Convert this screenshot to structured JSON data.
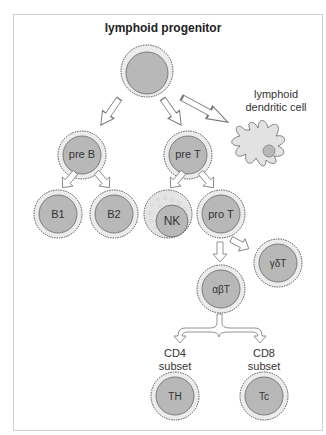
{
  "diagram": {
    "title": "lymphoid progenitor",
    "top_cut_text": "..",
    "cells": [
      {
        "id": "pre-b",
        "label": "pre B"
      },
      {
        "id": "pre-t",
        "label": "pre T"
      },
      {
        "id": "b1",
        "label": "B1"
      },
      {
        "id": "b2",
        "label": "B2"
      },
      {
        "id": "nk",
        "label": "NK"
      },
      {
        "id": "pro-t",
        "label": "pro T"
      },
      {
        "id": "gd-t",
        "label": "γδT"
      },
      {
        "id": "ab-t",
        "label": "αβT"
      },
      {
        "id": "th",
        "label": "TH"
      },
      {
        "id": "tc",
        "label": "Tc"
      }
    ],
    "dendritic_label": "lymphoid dendritic cell",
    "dendritic_line1": "lymphoid",
    "dendritic_line2": "dendritic cell",
    "cd4_line1": "CD4",
    "cd4_line2": "subset",
    "cd8_line1": "CD8",
    "cd8_line2": "subset",
    "colors": {
      "cell_fill": "#b8b8b8",
      "cell_ring": "#e8e8e8",
      "outline": "#555555",
      "frame": "#cfcfcf"
    }
  }
}
